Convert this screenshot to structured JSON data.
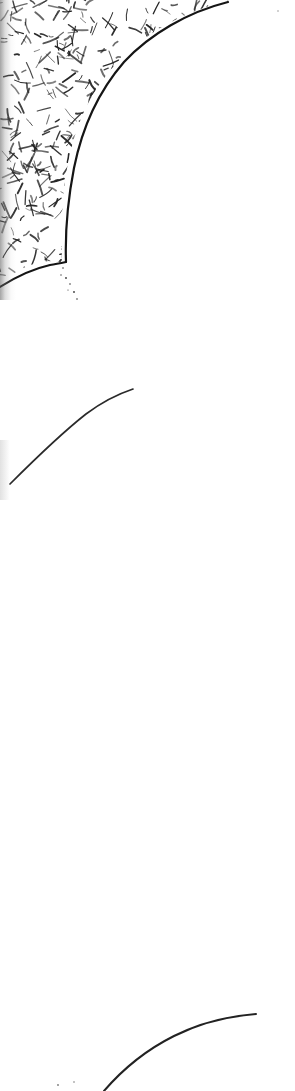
{
  "document": {
    "title": "Scanned engraving fragment",
    "page_width": 295,
    "page_height": 1091,
    "background_color": "#ffffff",
    "ink_color": "#1a1a1a",
    "description": "Monochrome scanned line-art fragment: dense random cross-hatched mass occupying the upper-left, bounded below and right by a heavy concave outline; a trail of small ink specks below it; a thin isolated arc at mid-page; a second thin curve entering the lower-right."
  },
  "artwork": {
    "regions": [
      {
        "name": "hatched-mass",
        "label": "Dense random cross-hatch field",
        "fill": "#ffffff",
        "stroke": "#222222",
        "stroke_count": 620,
        "stroke_length_min": 4,
        "stroke_length_max": 17,
        "stroke_width_min": 0.8,
        "stroke_width_max": 2.0,
        "bounds": {
          "x": 0,
          "y": 0,
          "width": 232,
          "height": 286
        },
        "outline_path": "M 0,0 L 231,0 C 170,14 120,48 92,96 C 66,142 60,196 62,262 C 40,258 18,268 0,284 Z"
      }
    ],
    "curves": [
      {
        "name": "mass-boundary-curve",
        "label": "Heavy concave outline of hatched mass",
        "stroke": "#151515",
        "stroke_width": 2.2,
        "path": "M 228,2 C 188,12 150,34 124,62 C 98,92 82,128 74,168 C 67,204 65,232 66,262"
      },
      {
        "name": "mass-base-curve",
        "label": "Lower boundary sweep of hatched mass",
        "stroke": "#151515",
        "stroke_width": 2.0,
        "path": "M 0,287 C 14,278 32,269 50,265 C 56,264 61,263 66,262"
      },
      {
        "name": "mid-arc",
        "label": "Thin isolated arc, mid page",
        "stroke": "#2a2a2a",
        "stroke_width": 1.7,
        "path": "M 10,484 C 32,462 58,436 86,414 C 102,402 118,394 133,389"
      },
      {
        "name": "lower-curve",
        "label": "Thin curve entering lower right",
        "stroke": "#222222",
        "stroke_width": 2.0,
        "path": "M 104,1091 C 122,1070 146,1050 174,1036 C 202,1022 230,1016 256,1014"
      }
    ],
    "speck_trails": [
      {
        "name": "boundary-speck-trail",
        "label": "Dotted ink trail below hatched mass",
        "fill": "#3a3a3a",
        "specks": [
          {
            "x": 60,
            "y": 262,
            "r": 0.9
          },
          {
            "x": 63,
            "y": 268,
            "r": 0.8
          },
          {
            "x": 61,
            "y": 275,
            "r": 0.7
          },
          {
            "x": 66,
            "y": 278,
            "r": 0.9
          },
          {
            "x": 70,
            "y": 284,
            "r": 0.8
          },
          {
            "x": 68,
            "y": 290,
            "r": 0.6
          },
          {
            "x": 74,
            "y": 292,
            "r": 0.9
          },
          {
            "x": 77,
            "y": 299,
            "r": 0.8
          }
        ]
      },
      {
        "name": "bottom-speck-pair",
        "label": "Two faint specks near bottom left",
        "fill": "#7a7a7a",
        "specks": [
          {
            "x": 58,
            "y": 1085,
            "r": 0.9
          },
          {
            "x": 74,
            "y": 1082,
            "r": 0.8
          }
        ]
      },
      {
        "name": "top-right-speck",
        "label": "Single faint speck near top right",
        "fill": "#9a9a9a",
        "specks": [
          {
            "x": 278,
            "y": 11,
            "r": 0.8
          }
        ]
      }
    ],
    "shadows": [
      {
        "name": "left-edge-scan-shadow",
        "label": "Dark scanner gutter shading along left edge",
        "color": "#5a5a5a"
      }
    ]
  }
}
